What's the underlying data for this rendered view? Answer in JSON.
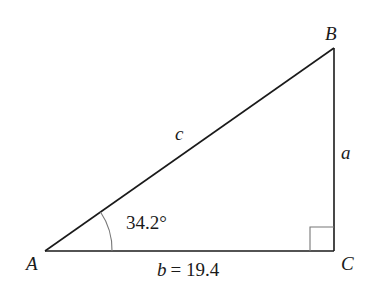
{
  "diagram": {
    "type": "right-triangle",
    "vertices": {
      "A": {
        "label": "A",
        "x": 45,
        "y": 251
      },
      "B": {
        "label": "B",
        "x": 334,
        "y": 48
      },
      "C": {
        "label": "C",
        "x": 334,
        "y": 251
      }
    },
    "sides": {
      "a": {
        "label": "a"
      },
      "b": {
        "label": "b = 19.4",
        "value": 19.4
      },
      "c": {
        "label": "c"
      }
    },
    "angle_A": {
      "label": "34.2°",
      "value": 34.2
    },
    "right_angle_at": "C",
    "colors": {
      "line": "#1a1a1a",
      "marker": "#777777",
      "background": "#ffffff"
    }
  }
}
